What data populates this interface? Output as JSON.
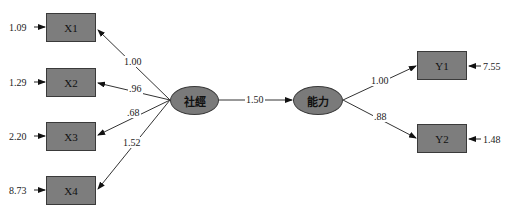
{
  "latent": {
    "exog": {
      "label": "社經"
    },
    "endog": {
      "label": "能力"
    }
  },
  "structural_path": {
    "from": "社經",
    "to": "能力",
    "value": "1.50"
  },
  "x_indicators": [
    {
      "label": "X1",
      "loading": "1.00",
      "error": "1.09"
    },
    {
      "label": "X2",
      "loading": ".96",
      "error": "1.29"
    },
    {
      "label": "X3",
      "loading": ".68",
      "error": "2.20"
    },
    {
      "label": "X4",
      "loading": "1.52",
      "error": "8.73"
    }
  ],
  "y_indicators": [
    {
      "label": "Y1",
      "loading": "1.00",
      "error": "7.55"
    },
    {
      "label": "Y2",
      "loading": ".88",
      "error": "1.48"
    }
  ],
  "colors": {
    "node_fill": "#7d7d7d",
    "line": "#333333",
    "background": "#ffffff"
  }
}
